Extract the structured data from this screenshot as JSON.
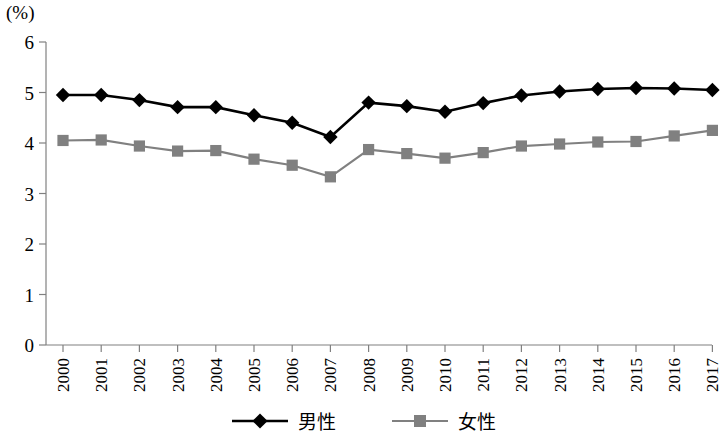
{
  "chart_data": {
    "type": "line",
    "title": "",
    "subtitle": "",
    "unit_label": "(%)",
    "xlabel": "",
    "ylabel": "",
    "ylim": [
      0,
      6
    ],
    "yticks": [
      "0",
      "1",
      "2",
      "3",
      "4",
      "5",
      "6"
    ],
    "grid": false,
    "legend_position": "bottom-center",
    "categories": [
      "2000",
      "2001",
      "2002",
      "2003",
      "2004",
      "2005",
      "2006",
      "2007",
      "2008",
      "2009",
      "2010",
      "2011",
      "2012",
      "2013",
      "2014",
      "2015",
      "2016",
      "2017"
    ],
    "series": [
      {
        "name": "男性",
        "marker": "diamond",
        "color": "#000000",
        "values": [
          4.95,
          4.95,
          4.85,
          4.71,
          4.71,
          4.55,
          4.4,
          4.12,
          4.8,
          4.73,
          4.62,
          4.79,
          4.94,
          5.02,
          5.07,
          5.09,
          5.08,
          5.05
        ]
      },
      {
        "name": "女性",
        "marker": "square",
        "color": "#808080",
        "values": [
          4.05,
          4.06,
          3.94,
          3.84,
          3.85,
          3.68,
          3.56,
          3.33,
          3.87,
          3.79,
          3.7,
          3.81,
          3.94,
          3.98,
          4.02,
          4.03,
          4.14,
          4.25
        ]
      }
    ]
  },
  "legend": {
    "items": [
      {
        "label": "男性",
        "color": "#000000",
        "marker": "diamond"
      },
      {
        "label": "女性",
        "color": "#808080",
        "marker": "square"
      }
    ]
  }
}
